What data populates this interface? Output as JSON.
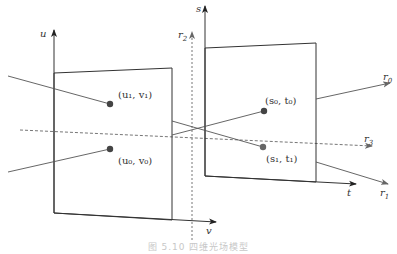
{
  "figure": {
    "caption": "图 5.10 四维光场模型",
    "axes": {
      "u": "u",
      "v": "v",
      "s": "s",
      "t": "t"
    },
    "rays": {
      "r0": "r0",
      "r1": "r1",
      "r2": "r2",
      "r3": "r3"
    },
    "points": {
      "u1v1": "(u₁, v₁)",
      "u0v0": "(u₀, v₀)",
      "s0t0": "(s₀, t₀)",
      "s1t1": "(s₁, t₁)"
    },
    "colors": {
      "line": "#333333",
      "ray": "#555555",
      "point": "#444444",
      "caption": "#c8c8c8"
    }
  }
}
